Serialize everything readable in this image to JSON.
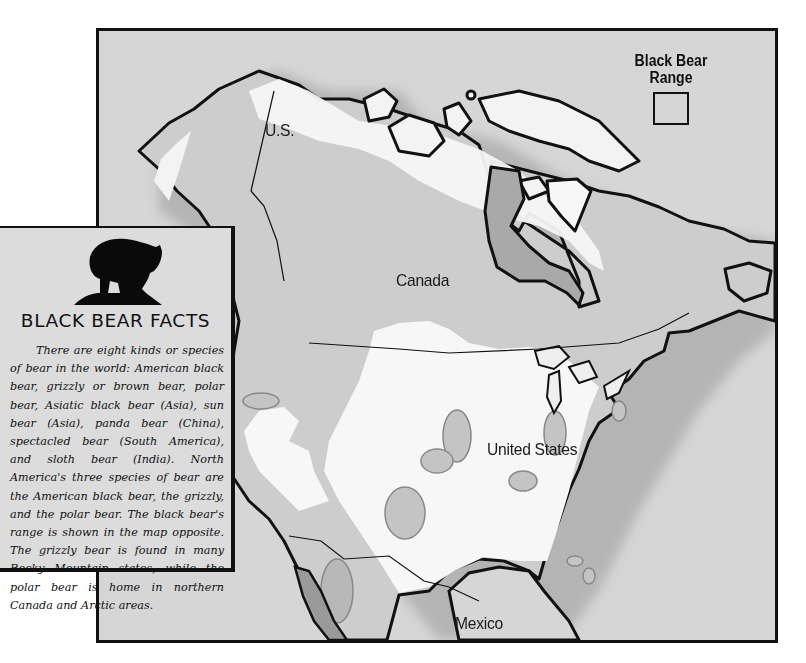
{
  "map": {
    "labels": {
      "us_alaska": "U.S.",
      "canada": "Canada",
      "united_states": "United States",
      "mexico": "Mexico"
    },
    "legend": {
      "title_line1": "Black Bear",
      "title_line2": "Range",
      "swatch_color": "#d6d6d6"
    },
    "colors": {
      "ocean": "#d3d3d3",
      "land_outside_range": "#f4f4f4",
      "black_bear_range": "#c9c9c9",
      "coastline": "#111111"
    }
  },
  "facts_card": {
    "icon": "bear-silhouette-icon",
    "title": "BLACK BEAR FACTS",
    "body": "There are eight kinds or species of bear in the world: American black bear, grizzly or brown bear, polar bear, Asiatic black bear (Asia), sun bear (Asia), panda bear (China), spectacled bear (South America), and sloth bear (India). North America's three species of bear are the American black bear, the grizzly, and the polar bear. The black bear's range is shown in the map opposite. The grizzly bear is found in many Rocky Mountain states, while the polar bear is home in northern Canada and Arctic areas."
  }
}
